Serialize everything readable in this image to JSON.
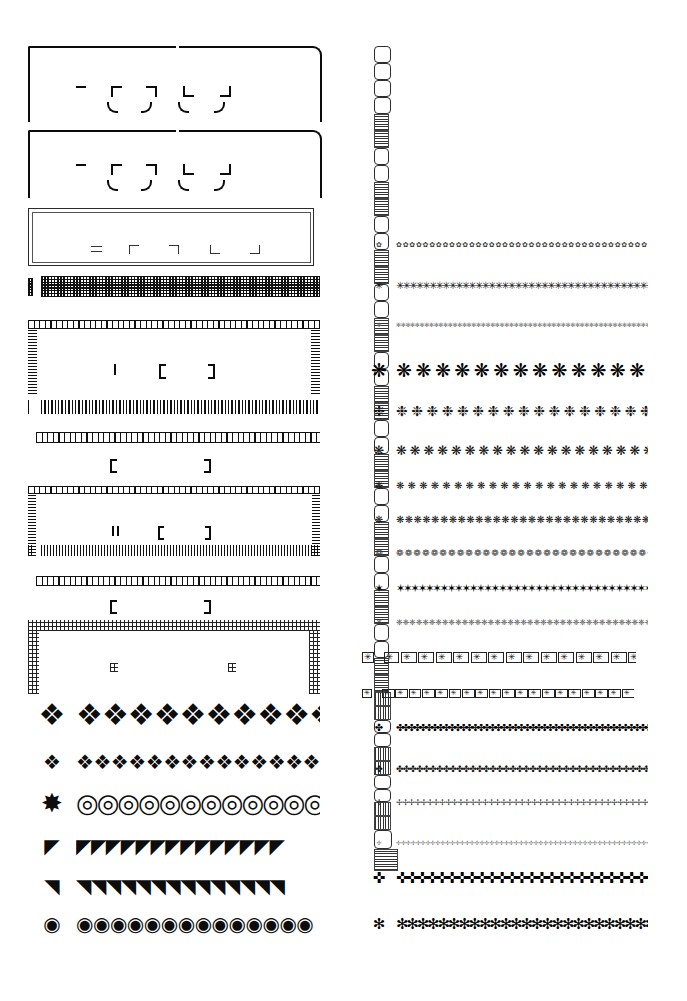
{
  "page": {
    "background_color": "#ffffff",
    "ink_color": "#111111",
    "width": 687,
    "height": 1001,
    "columns": 2
  },
  "left_column": {
    "label": "Borders, rules and corner ornaments",
    "specimens": [
      {
        "id": "corner-bracket-frame-1",
        "kind": "corner-bracket-frame",
        "description": "Open rectangular frame of four heavy corner brackets with small inner corner ticks",
        "top": 46,
        "height": 72,
        "inner_marks": [
          "dash",
          "corner-tl",
          "corner-tr",
          "corner-bl",
          "corner-br",
          "arc-bl",
          "arc-br",
          "arc-tl",
          "arc-tr"
        ]
      },
      {
        "id": "corner-bracket-frame-2",
        "kind": "corner-bracket-frame",
        "description": "Repeat of the corner bracket frame, second showing",
        "top": 130,
        "height": 66,
        "inner_marks": [
          "dash",
          "corner-tl",
          "corner-tr",
          "corner-bl",
          "corner-br",
          "arc-bl",
          "arc-br",
          "arc-tl",
          "arc-tr"
        ]
      },
      {
        "id": "double-hairline-frame",
        "kind": "double-rule-frame",
        "description": "Thin double hairline rectangular frame with five small corner-piece samples inside",
        "top": 208,
        "height": 60,
        "sample_pieces": [
          "equals",
          "corner-tl",
          "corner-tr",
          "corner-bl",
          "corner-br"
        ]
      },
      {
        "id": "fine-checker-rule",
        "kind": "rule",
        "description": "Heavy fine checkerboard band rule with single-unit sample at left",
        "top": 278,
        "height": 20,
        "pattern": "checkerboard"
      },
      {
        "id": "picket-frame-1",
        "kind": "three-sided-frame",
        "description": "Three-sided border of picket bars interrupted by small open squares; bracket samples inside",
        "top": 322,
        "height": 70,
        "pattern": "picket-with-squares",
        "inner_marks": [
          "bar",
          "bracket-left",
          "bracket-right"
        ]
      },
      {
        "id": "picket-rule",
        "kind": "rule",
        "description": "Plain picket (vertical bar) rule with single-unit sample at left",
        "top": 400,
        "height": 16,
        "pattern": "vertical-bars"
      },
      {
        "id": "open-square-rule",
        "kind": "rule",
        "description": "Row of open squares rule, with bracket samples below",
        "top": 432,
        "height": 14,
        "pattern": "open-squares",
        "inner_marks": [
          "bracket-left",
          "bracket-right"
        ]
      },
      {
        "id": "picket-frame-2",
        "kind": "three-sided-frame",
        "description": "Second three-sided picket border, finer pitch; bracket samples inside",
        "top": 486,
        "height": 68,
        "pattern": "picket-with-squares",
        "inner_marks": [
          "double-bar",
          "bracket-left",
          "bracket-right"
        ]
      },
      {
        "id": "picket-rule-2",
        "kind": "rule",
        "description": "Fine picket rule with double-bar sample at left",
        "top": 544,
        "height": 14,
        "pattern": "vertical-bars-fine"
      },
      {
        "id": "open-square-rule-2",
        "kind": "rule",
        "description": "Second row of open squares rule with bracket samples below",
        "top": 576,
        "height": 14,
        "pattern": "open-squares",
        "inner_marks": [
          "bracket-left",
          "bracket-right"
        ]
      },
      {
        "id": "grid-frame",
        "kind": "three-sided-frame",
        "description": "Three-sided border of fine grid/mesh bands, two small mesh samples inside",
        "top": 620,
        "height": 72,
        "pattern": "fine-grid-mesh",
        "inner_marks": [
          "mesh-block",
          "mesh-block"
        ]
      },
      {
        "id": "scroll-chain-large",
        "kind": "ornament-strip",
        "description": "Large interlocking scroll / hourglass chain ornament",
        "top": 700,
        "height": 40,
        "glyph": "scroll-chain",
        "repeat_count": 10
      },
      {
        "id": "scroll-chain-small",
        "kind": "ornament-strip",
        "description": "Small interlocking scroll chain ornament",
        "top": 752,
        "height": 28,
        "glyph": "scroll-chain",
        "repeat_count": 15
      },
      {
        "id": "bold-ring-chain",
        "kind": "ornament-strip",
        "description": "Bold solid chain of rings / linked circles",
        "top": 790,
        "height": 30,
        "glyph": "ring-chain",
        "repeat_count": 13
      },
      {
        "id": "scroll-corner-strip",
        "kind": "ornament-strip",
        "description": "Square tiles with inward scrolling hook motif, reversed out of black",
        "top": 832,
        "height": 28,
        "glyph": "hook-tile",
        "repeat_count": 14
      },
      {
        "id": "quadrant-strip",
        "kind": "ornament-strip",
        "description": "Square tiles with nested quarter-circle quadrant motif, reversed out of black",
        "top": 872,
        "height": 28,
        "glyph": "quadrant-tile",
        "repeat_count": 14
      },
      {
        "id": "eye-spiral-strip",
        "kind": "ornament-strip",
        "description": "Square tiles with spiral 'eye' motif, reversed out of black",
        "top": 912,
        "height": 28,
        "glyph": "spiral-eye-tile",
        "repeat_count": 14
      }
    ]
  },
  "right_column": {
    "label": "Floral asterisks, snowflakes and crosses",
    "plate": {
      "id": "rounded-cell-frame",
      "kind": "composite-frame",
      "description": "Rectangular plate frame built from alternating rounded blank squares and line-hatched blocks; two small samples floating in the field",
      "top": 46,
      "height": 92,
      "corner_cells": 4,
      "top_cells": 17,
      "side_cells": 5,
      "inner_samples": [
        "blank-rounded-square",
        "hatched-block"
      ]
    },
    "specimens": [
      {
        "id": "tiny-flower-ring",
        "glyph": "✿",
        "size": 7,
        "spacing": 7.2,
        "top": 238,
        "count": 44,
        "weight": "light",
        "description": "tiny open flower ring"
      },
      {
        "id": "six-point-asterisk",
        "glyph": "✳",
        "size": 10,
        "spacing": 7.4,
        "top": 278,
        "count": 42,
        "weight": "regular",
        "description": "six-point asterisk"
      },
      {
        "id": "hairline-floret",
        "glyph": "✻",
        "size": 6,
        "spacing": 5.2,
        "top": 318,
        "count": 56,
        "weight": "hairline",
        "description": "fine hairline floret"
      },
      {
        "id": "large-snowflake",
        "glyph": "❋",
        "size": 19,
        "spacing": 21.0,
        "top": 355,
        "count": 13,
        "weight": "bold",
        "description": "large snowflake / eight-point star"
      },
      {
        "id": "medium-snowflake",
        "glyph": "❉",
        "size": 14,
        "spacing": 16.4,
        "top": 400,
        "count": 17,
        "weight": "regular",
        "description": "medium snowflake floret"
      },
      {
        "id": "snowflake-flower",
        "glyph": "❋",
        "size": 13,
        "spacing": 14.8,
        "top": 440,
        "count": 19,
        "weight": "regular",
        "description": "snowflake flower"
      },
      {
        "id": "small-floret",
        "glyph": "❋",
        "size": 10,
        "spacing": 12.4,
        "top": 478,
        "count": 22,
        "weight": "regular",
        "description": "small floret"
      },
      {
        "id": "dense-floret",
        "glyph": "❋",
        "size": 10,
        "spacing": 9.6,
        "top": 512,
        "count": 29,
        "weight": "regular",
        "description": "dense floret row"
      },
      {
        "id": "petite-floret",
        "glyph": "❁",
        "size": 9,
        "spacing": 9.4,
        "top": 546,
        "count": 30,
        "weight": "light",
        "description": "petite rosette"
      },
      {
        "id": "bold-asterisk",
        "glyph": "✶",
        "size": 11,
        "spacing": 8.2,
        "top": 580,
        "count": 35,
        "weight": "bold",
        "description": "bold six-point asterisk"
      },
      {
        "id": "fine-snow-row",
        "glyph": "❈",
        "size": 8,
        "spacing": 7.2,
        "top": 616,
        "count": 40,
        "weight": "light",
        "description": "fine snow row"
      },
      {
        "id": "boxed-asterisk",
        "glyph": "✳",
        "size": 9,
        "spacing": 12.6,
        "top": 650,
        "count": 22,
        "weight": "regular",
        "description": "asterisk inside square box",
        "boxed": true
      },
      {
        "id": "boxed-asterisk-small",
        "glyph": "✳",
        "size": 7,
        "spacing": 9.4,
        "top": 686,
        "count": 30,
        "weight": "regular",
        "description": "small asterisk inside square box",
        "boxed": true
      },
      {
        "id": "cross-cluster-double",
        "glyph": "✤",
        "size": 10,
        "spacing": 6.6,
        "top": 720,
        "count": 43,
        "weight": "bold",
        "description": "double row of clustered crosses",
        "rows": 2
      },
      {
        "id": "cross-row",
        "glyph": "✤",
        "size": 9,
        "spacing": 7.4,
        "top": 762,
        "count": 39,
        "weight": "regular",
        "description": "single row of clustered crosses"
      },
      {
        "id": "open-cross-row",
        "glyph": "✢",
        "size": 8,
        "spacing": 6.8,
        "top": 796,
        "count": 42,
        "weight": "light",
        "description": "open cross row"
      },
      {
        "id": "hairline-cross-row",
        "glyph": "✢",
        "size": 6,
        "spacing": 5.4,
        "top": 836,
        "count": 53,
        "weight": "hairline",
        "description": "hairline cross row"
      },
      {
        "id": "maltese-cross-row",
        "glyph": "✜",
        "size": 15,
        "spacing": 11.2,
        "top": 866,
        "count": 26,
        "weight": "bold",
        "description": "bold maltese / budded cross row"
      },
      {
        "id": "star-asterisk-row",
        "glyph": "✻",
        "size": 15,
        "spacing": 11.6,
        "top": 912,
        "count": 25,
        "weight": "bold",
        "description": "bold star asterisk row"
      }
    ]
  }
}
